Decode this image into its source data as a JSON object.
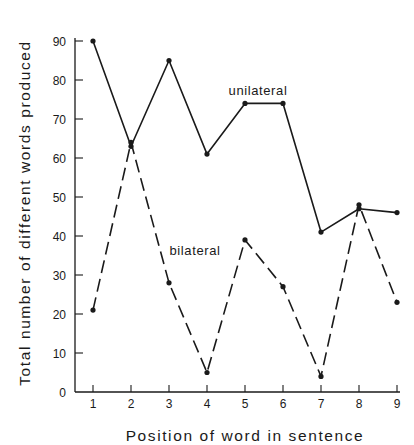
{
  "chart_data": {
    "type": "line",
    "title": "",
    "xlabel": "Position of word in sentence",
    "ylabel": "Total number of different words produced",
    "x": [
      1,
      2,
      3,
      4,
      5,
      6,
      7,
      8,
      9
    ],
    "x_ticks": [
      "1",
      "2",
      "3",
      "4",
      "5",
      "6",
      "7",
      "8",
      "9"
    ],
    "y_ticks": [
      "0",
      "10",
      "20",
      "30",
      "40",
      "50",
      "60",
      "70",
      "80",
      "90"
    ],
    "ylim": [
      0,
      90
    ],
    "xlim": [
      0.5,
      9
    ],
    "grid": false,
    "legend": "inline labels",
    "series": [
      {
        "name": "unilateral",
        "style": "solid",
        "values": [
          90,
          63,
          85,
          61,
          74,
          74,
          41,
          47,
          46
        ],
        "label_pos": {
          "x": 258,
          "y": 95
        }
      },
      {
        "name": "bilateral",
        "style": "dashed",
        "values": [
          21,
          64,
          28,
          5,
          39,
          27,
          4,
          48,
          23
        ],
        "label_pos": {
          "x": 195,
          "y": 255
        }
      }
    ],
    "colors": {
      "line": "#1a1a1a",
      "background": "#ffffff"
    }
  }
}
